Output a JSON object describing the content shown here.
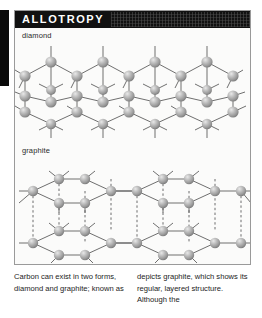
{
  "page": {
    "title": "ALLOTROPY",
    "background_color": "#ffffff",
    "header_color": "#111111",
    "header_text_color": "#ffffff",
    "panel_border_color": "#9a9a9a",
    "panel_background": "#fbfbfa",
    "atom_color": "#a8a8a8",
    "bond_color": "#5a5a5a",
    "spine_color": "#0a0a0a"
  },
  "figures": {
    "diamond": {
      "label": "diamond",
      "description": "tetrahedral covalent lattice of carbon atoms",
      "atom_count_visible": 34
    },
    "graphite": {
      "label": "graphite",
      "description": "stacked hexagonal layers of carbon atoms joined by dashed interlayer lines",
      "layers": 2
    }
  },
  "caption": {
    "left_column": "Carbon can exist in two forms, diamond and graphite; known as",
    "right_column": "depicts graphite, which shows its regular, layered structure. Although the"
  }
}
